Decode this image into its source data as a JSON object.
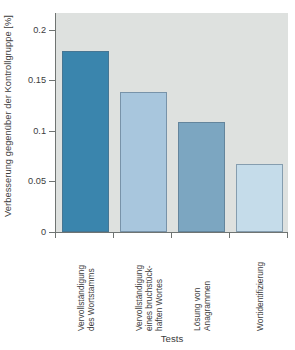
{
  "chart_data": {
    "type": "bar",
    "title": "",
    "xlabel": "Tests",
    "ylabel": "Verbesserung gegenüber der Kontrollgruppe [%]",
    "categories": [
      "Vervollständigung\ndes Wortstamms",
      "Vervollständigung\neines bruchstück-\nhaften Wortes",
      "Lösung von\nAnagrammen",
      "Wortidentifizierung"
    ],
    "values": [
      0.178,
      0.137,
      0.108,
      0.067
    ],
    "ylim": [
      0,
      0.215
    ],
    "yticks": [
      0,
      0.05,
      0.1,
      0.15,
      0.2
    ],
    "ytick_labels": [
      "0",
      "0.05",
      "0.1",
      "0.15",
      "0.2"
    ],
    "grid": false,
    "legend": "none",
    "bar_colors": [
      "#3a85ad",
      "#a8c6dd",
      "#7ca6c1",
      "#c5dcea"
    ],
    "plot_background": "#dee1df",
    "figure_background": "#ffffff",
    "axis_color": "#6f7472"
  }
}
